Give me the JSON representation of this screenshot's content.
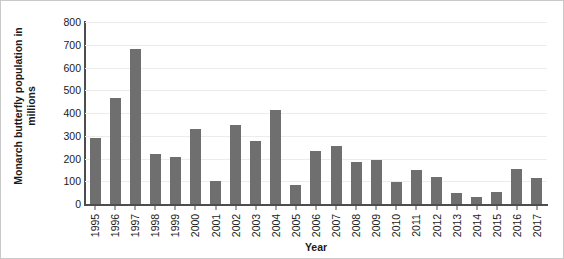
{
  "chart_data": {
    "type": "bar",
    "title": "",
    "xlabel": "Year",
    "ylabel": "Monarch butterfly population in millions",
    "ylabel_lines": [
      "Monarch butterfly population in",
      "millions"
    ],
    "categories": [
      "1995",
      "1996",
      "1997",
      "1998",
      "1999",
      "2000",
      "2001",
      "2002",
      "2003",
      "2004",
      "2005",
      "2006",
      "2007",
      "2008",
      "2009",
      "2010",
      "2011",
      "2012",
      "2013",
      "2014",
      "2015",
      "2016",
      "2017"
    ],
    "values": [
      290,
      468,
      682,
      220,
      205,
      330,
      103,
      348,
      278,
      412,
      85,
      232,
      255,
      185,
      195,
      95,
      150,
      120,
      50,
      32,
      51,
      152,
      115
    ],
    "ylim": [
      0,
      800
    ],
    "ytick_labels": [
      "0",
      "100",
      "200",
      "300",
      "400",
      "500",
      "600",
      "700",
      "800"
    ],
    "ytick_values": [
      0,
      100,
      200,
      300,
      400,
      500,
      600,
      700,
      800
    ],
    "grid": true,
    "grid_axis": "y",
    "legend": null,
    "bar_color": "#6f6f6f",
    "axis_color": "#4d4d4d",
    "grid_color": "#ececec",
    "text_color": "#1a1a1a",
    "background": "#ffffff"
  }
}
